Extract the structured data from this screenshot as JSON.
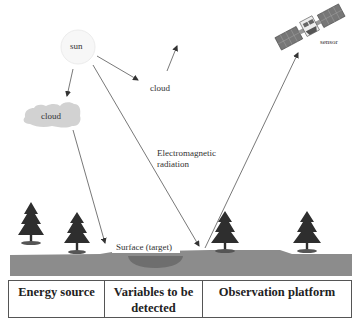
{
  "diagram": {
    "nodes": {
      "sun": "sun",
      "cloud_left": "cloud",
      "cloud_right": "cloud",
      "sensor": "sensor",
      "radiation": [
        "Electromagnetic",
        "radiation"
      ],
      "surface": "Surface (target)"
    },
    "colors": {
      "ground": "#8c8c8c",
      "pond": "#6e6e6e",
      "cloud_fill": "#d2d2d2",
      "tree": "#2e2e2e",
      "line": "#555555"
    }
  },
  "table": {
    "columns": [
      {
        "label": "Energy source"
      },
      {
        "label": "Variables to be detected",
        "lines": [
          "Variables to be",
          "detected"
        ]
      },
      {
        "label": "Observation platform"
      }
    ]
  }
}
